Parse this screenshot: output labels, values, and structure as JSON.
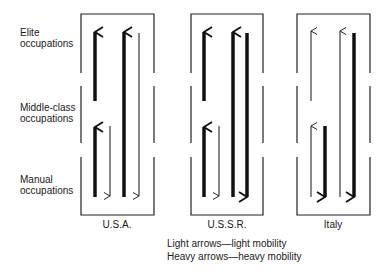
{
  "rows": {
    "elite": {
      "line1": "Elite",
      "line2": "occupations"
    },
    "middle": {
      "line1": "Middle-class",
      "line2": "occupations"
    },
    "manual": {
      "line1": "Manual",
      "line2": "occupations"
    }
  },
  "panels": [
    {
      "label": "U.S.A."
    },
    {
      "label": "U.S.S.R."
    },
    {
      "label": "Italy"
    }
  ],
  "legend": {
    "light": "Light arrows—light mobility",
    "heavy": "Heavy arrows—heavy mobility"
  },
  "diagram": {
    "type": "social-mobility-comparison",
    "levels": [
      "Elite occupations",
      "Middle-class occupations",
      "Manual occupations"
    ],
    "flows": {
      "U.S.A.": [
        {
          "from": "Middle-class",
          "to": "Elite",
          "weight": "heavy"
        },
        {
          "from": "Manual",
          "to": "Middle-class",
          "weight": "heavy"
        },
        {
          "from": "Middle-class",
          "to": "Manual",
          "weight": "light"
        },
        {
          "from": "Manual",
          "to": "Elite",
          "weight": "heavy"
        },
        {
          "from": "Elite",
          "to": "Manual",
          "weight": "light"
        }
      ],
      "U.S.S.R.": [
        {
          "from": "Middle-class",
          "to": "Elite",
          "weight": "heavy"
        },
        {
          "from": "Manual",
          "to": "Middle-class",
          "weight": "heavy"
        },
        {
          "from": "Middle-class",
          "to": "Manual",
          "weight": "light"
        },
        {
          "from": "Manual",
          "to": "Elite",
          "weight": "heavy"
        },
        {
          "from": "Elite",
          "to": "Manual",
          "weight": "heavy"
        }
      ],
      "Italy": [
        {
          "from": "Middle-class",
          "to": "Elite",
          "weight": "light"
        },
        {
          "from": "Manual",
          "to": "Middle-class",
          "weight": "light"
        },
        {
          "from": "Middle-class",
          "to": "Manual",
          "weight": "heavy"
        },
        {
          "from": "Manual",
          "to": "Elite",
          "weight": "light"
        },
        {
          "from": "Elite",
          "to": "Manual",
          "weight": "heavy"
        }
      ]
    }
  }
}
